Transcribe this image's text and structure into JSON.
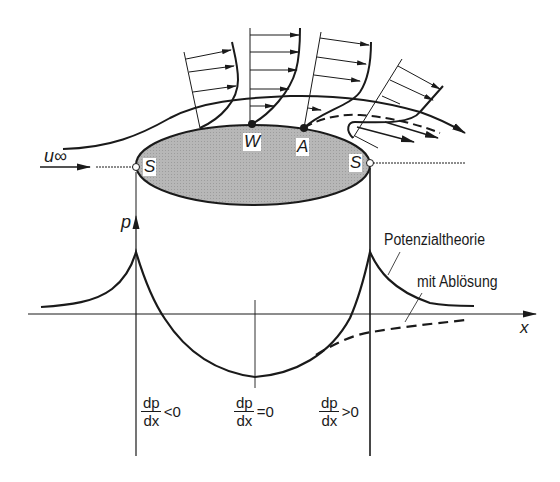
{
  "figure": {
    "labels": {
      "freestream_velocity": "u∞",
      "stagnation_front": "S",
      "stagnation_rear": "S",
      "inflection_point": "W",
      "separation_point": "A",
      "pressure_axis": "p",
      "x_axis": "x"
    },
    "legend": {
      "potential_theory": "Potenzialtheorie",
      "with_separation": "mit Ablösung"
    },
    "gradient_labels": [
      {
        "numerator": "dp",
        "denominator": "dx",
        "relation": "<0"
      },
      {
        "numerator": "dp",
        "denominator": "dx",
        "relation": "=0"
      },
      {
        "numerator": "dp",
        "denominator": "dx",
        "relation": ">0"
      }
    ],
    "colors": {
      "line": "#1a1a1a",
      "body_fill": "#b4b4b4",
      "background": "#ffffff"
    }
  }
}
